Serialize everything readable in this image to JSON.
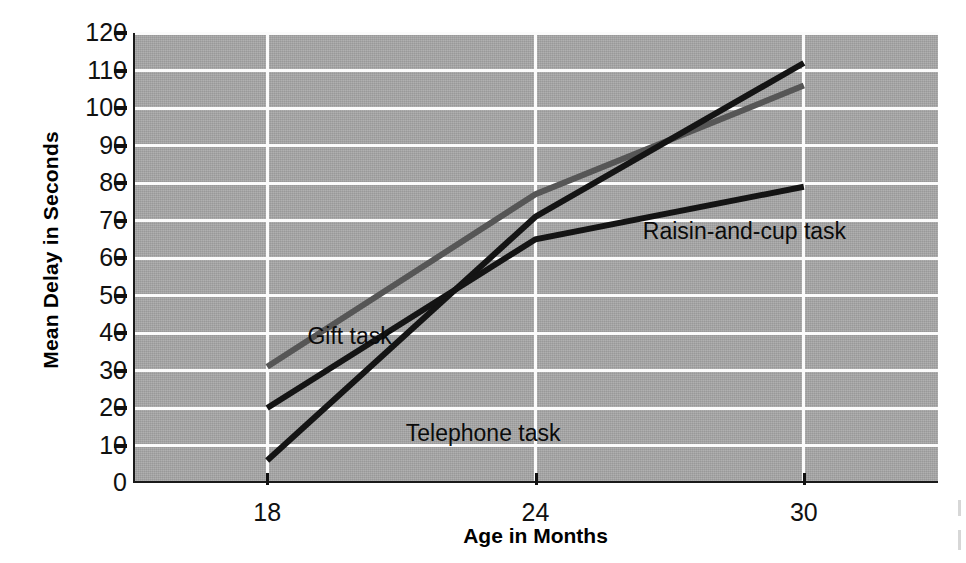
{
  "chart_data": {
    "type": "line",
    "title": "",
    "xlabel": "Age in Months",
    "ylabel": "Mean Delay in Seconds",
    "x": [
      18,
      24,
      30
    ],
    "xlim": [
      15,
      33
    ],
    "ylim": [
      0,
      120
    ],
    "xtick_labels": [
      "18",
      "24",
      "30"
    ],
    "ytick_labels": [
      "0",
      "10",
      "20",
      "30",
      "40",
      "50",
      "60",
      "70",
      "80",
      "90",
      "100",
      "110",
      "120"
    ],
    "ytick_values": [
      0,
      10,
      20,
      30,
      40,
      50,
      60,
      70,
      80,
      90,
      100,
      110,
      120
    ],
    "grid": true,
    "grid_color": "#fbfbfb",
    "plot_background": "#a8a8a8",
    "legend_position": "inline-labels",
    "series": [
      {
        "name": "Gift task",
        "values": [
          31,
          77,
          106
        ],
        "color": "#565656",
        "label_x": 18.9,
        "label_y": 39
      },
      {
        "name": "Telephone task",
        "values": [
          6,
          71,
          112
        ],
        "color": "#141414",
        "label_x": 21.1,
        "label_y": 13
      },
      {
        "name": "Raisin-and-cup task",
        "values": [
          20,
          65,
          79
        ],
        "color": "#141414",
        "label_x": 26.4,
        "label_y": 67
      }
    ]
  },
  "axis": {
    "y_title": "Mean Delay in Seconds",
    "x_title": "Age in Months"
  }
}
